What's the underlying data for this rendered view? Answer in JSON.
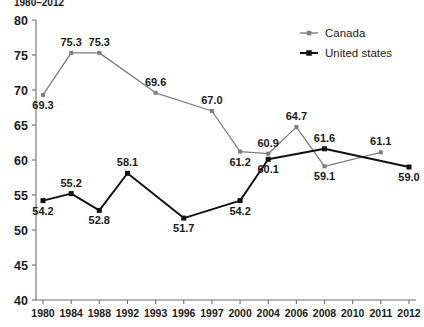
{
  "title_clipped": "1980–2012",
  "legend": {
    "position": "top-right",
    "entries": [
      {
        "label": "Canada",
        "color": "#7d7d7d",
        "marker": "square"
      },
      {
        "label": "United states",
        "color": "#111111",
        "marker": "square"
      }
    ]
  },
  "axis": {
    "y_ticks": [
      "40",
      "45",
      "50",
      "55",
      "60",
      "65",
      "70",
      "75",
      "80"
    ],
    "x_ticks": [
      "1980",
      "1984",
      "1988",
      "1992",
      "1993",
      "1996",
      "1997",
      "2000",
      "2004",
      "2006",
      "2008",
      "2010",
      "2011",
      "2012"
    ]
  },
  "chart_data": {
    "type": "line",
    "title": "1980–2012",
    "xlabel": "",
    "ylabel": "",
    "ylim": [
      40,
      80
    ],
    "ytick_step": 5,
    "grid": false,
    "legend_position": "top-right",
    "categories": [
      "1980",
      "1984",
      "1988",
      "1992",
      "1993",
      "1996",
      "1997",
      "2000",
      "2004",
      "2006",
      "2008",
      "2010",
      "2011",
      "2012"
    ],
    "series": [
      {
        "name": "Canada",
        "color": "#7d7d7d",
        "points": [
          {
            "x": "1980",
            "y": 69.3,
            "label": "69.3",
            "label_pos": "below"
          },
          {
            "x": "1984",
            "y": 75.3,
            "label": "75.3",
            "label_pos": "above"
          },
          {
            "x": "1988",
            "y": 75.3,
            "label": "75.3",
            "label_pos": "above"
          },
          {
            "x": "1993",
            "y": 69.6,
            "label": "69.6",
            "label_pos": "above"
          },
          {
            "x": "1997",
            "y": 67.0,
            "label": "67.0",
            "label_pos": "above"
          },
          {
            "x": "2000",
            "y": 61.2,
            "label": "61.2",
            "label_pos": "below"
          },
          {
            "x": "2004",
            "y": 60.9,
            "label": "60.9",
            "label_pos": "above"
          },
          {
            "x": "2006",
            "y": 64.7,
            "label": "64.7",
            "label_pos": "above"
          },
          {
            "x": "2008",
            "y": 59.1,
            "label": "59.1",
            "label_pos": "below"
          },
          {
            "x": "2011",
            "y": 61.1,
            "label": "61.1",
            "label_pos": "above"
          }
        ]
      },
      {
        "name": "United states",
        "color": "#111111",
        "points": [
          {
            "x": "1980",
            "y": 54.2,
            "label": "54.2",
            "label_pos": "below"
          },
          {
            "x": "1984",
            "y": 55.2,
            "label": "55.2",
            "label_pos": "above"
          },
          {
            "x": "1988",
            "y": 52.8,
            "label": "52.8",
            "label_pos": "below"
          },
          {
            "x": "1992",
            "y": 58.1,
            "label": "58.1",
            "label_pos": "above"
          },
          {
            "x": "1996",
            "y": 51.7,
            "label": "51.7",
            "label_pos": "below"
          },
          {
            "x": "2000",
            "y": 54.2,
            "label": "54.2",
            "label_pos": "below"
          },
          {
            "x": "2004",
            "y": 60.1,
            "label": "60.1",
            "label_pos": "below"
          },
          {
            "x": "2008",
            "y": 61.6,
            "label": "61.6",
            "label_pos": "above"
          },
          {
            "x": "2012",
            "y": 59.0,
            "label": "59.0",
            "label_pos": "below"
          }
        ]
      }
    ]
  }
}
